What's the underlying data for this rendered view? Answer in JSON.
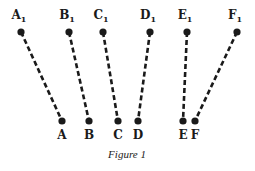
{
  "caption": "Figure 1",
  "colors": {
    "ink": "#1a1a1a",
    "background": "#ffffff"
  },
  "segments": [
    {
      "top": {
        "label": "A",
        "sub": "1",
        "x": 21,
        "y": 32
      },
      "bottom": {
        "label": "A",
        "x": 62,
        "y": 121
      }
    },
    {
      "top": {
        "label": "B",
        "sub": "1",
        "x": 69,
        "y": 32
      },
      "bottom": {
        "label": "B",
        "x": 89,
        "y": 121
      }
    },
    {
      "top": {
        "label": "C",
        "sub": "1",
        "x": 103,
        "y": 32
      },
      "bottom": {
        "label": "C",
        "x": 118,
        "y": 121
      }
    },
    {
      "top": {
        "label": "D",
        "sub": "1",
        "x": 150,
        "y": 32
      },
      "bottom": {
        "label": "D",
        "x": 138,
        "y": 121
      }
    },
    {
      "top": {
        "label": "E",
        "sub": "1",
        "x": 187,
        "y": 32
      },
      "bottom": {
        "label": "E",
        "x": 183,
        "y": 121
      }
    },
    {
      "top": {
        "label": "F",
        "sub": "1",
        "x": 237,
        "y": 32
      },
      "bottom": {
        "label": "F",
        "x": 195,
        "y": 121
      }
    }
  ]
}
